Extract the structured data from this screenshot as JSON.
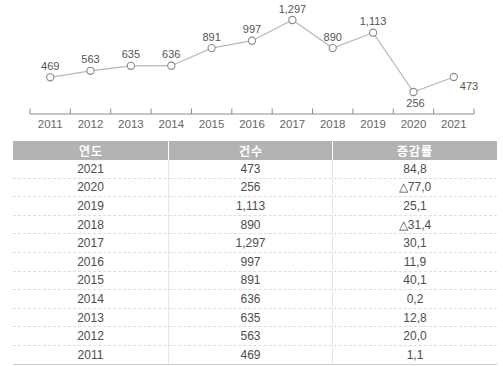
{
  "chart_data": [
    {
      "type": "line",
      "title": "",
      "xlabel": "",
      "ylabel": "",
      "categories": [
        "2011",
        "2012",
        "2013",
        "2014",
        "2015",
        "2016",
        "2017",
        "2018",
        "2019",
        "2020",
        "2021"
      ],
      "series": [
        {
          "name": "건수",
          "values": [
            469,
            563,
            635,
            636,
            891,
            997,
            1297,
            890,
            1113,
            256,
            473
          ]
        }
      ],
      "point_labels": [
        "469",
        "563",
        "635",
        "636",
        "891",
        "997",
        "1,297",
        "890",
        "1,113",
        "256",
        "473"
      ],
      "point_label_positions": [
        "above",
        "above",
        "above",
        "above",
        "above",
        "above",
        "above",
        "above",
        "above",
        "below",
        "below-right"
      ],
      "ylim": [
        0,
        1400
      ],
      "grid": false,
      "legend": "none",
      "marker": "open-circle",
      "colors": {
        "line": "#b8b8b8",
        "marker_stroke": "#8a8a8a",
        "marker_fill": "#ffffff",
        "point_label": "#555555",
        "axis": "#8c8c8c",
        "axis_label": "#666666"
      }
    },
    {
      "type": "table",
      "columns": [
        "연도",
        "건수",
        "증감률"
      ],
      "rows": [
        [
          "2021",
          "473",
          "84,8"
        ],
        [
          "2020",
          "256",
          "△77,0"
        ],
        [
          "2019",
          "1,113",
          "25,1"
        ],
        [
          "2018",
          "890",
          "△31,4"
        ],
        [
          "2017",
          "1,297",
          "30,1"
        ],
        [
          "2016",
          "997",
          "11,9"
        ],
        [
          "2015",
          "891",
          "40,1"
        ],
        [
          "2014",
          "636",
          "0,2"
        ],
        [
          "2013",
          "635",
          "12,8"
        ],
        [
          "2012",
          "563",
          "20,0"
        ],
        [
          "2011",
          "469",
          "1,1"
        ]
      ],
      "header_bg": "#b3b3b3",
      "header_text_color": "#ffffff",
      "body_text_color": "#4d4d4d"
    }
  ]
}
